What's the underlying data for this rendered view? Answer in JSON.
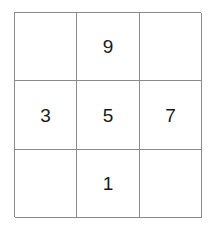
{
  "grid": {
    "rows": 3,
    "columns": 3,
    "border_color": "#8a8a8a",
    "background_color": "#ffffff",
    "digit_color": "#1a1a1a",
    "cells": [
      {
        "row": 0,
        "col": 0,
        "value": ""
      },
      {
        "row": 0,
        "col": 1,
        "value": "9"
      },
      {
        "row": 0,
        "col": 2,
        "value": ""
      },
      {
        "row": 1,
        "col": 0,
        "value": "3"
      },
      {
        "row": 1,
        "col": 1,
        "value": "5"
      },
      {
        "row": 1,
        "col": 2,
        "value": "7"
      },
      {
        "row": 2,
        "col": 0,
        "value": ""
      },
      {
        "row": 2,
        "col": 1,
        "value": "1"
      },
      {
        "row": 2,
        "col": 2,
        "value": ""
      }
    ]
  }
}
